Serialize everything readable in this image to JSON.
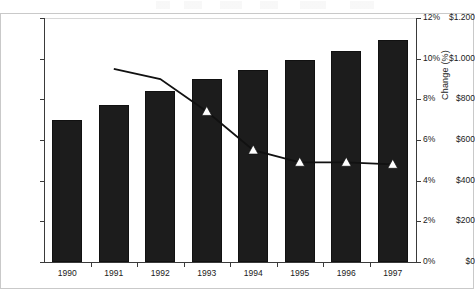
{
  "chart_data": {
    "type": "bar",
    "title": "",
    "subtitle": "",
    "xlabel": "",
    "ylabel": "",
    "categories": [
      "1990",
      "1991",
      "1992",
      "1993",
      "1994",
      "1995",
      "1996",
      "1997"
    ],
    "grid": false,
    "legend": "none",
    "series": [
      {
        "name": "Amount",
        "chart_type": "bar",
        "axis": "left",
        "values": [
          700,
          770,
          840,
          900,
          945,
          995,
          1040,
          1090
        ],
        "color": "#1c1c1c"
      },
      {
        "name": "Change (%)",
        "chart_type": "line",
        "axis": "right",
        "marker": "triangle-up",
        "marker_fill": "#ffffff",
        "color": "#111111",
        "values": [
          null,
          9.5,
          9.0,
          7.4,
          5.5,
          4.9,
          4.9,
          4.8
        ]
      }
    ],
    "left_axis": {
      "ylim": [
        0,
        1200
      ],
      "tick_values": [
        0,
        200,
        400,
        600,
        800,
        1000,
        1200
      ],
      "tick_labels": [
        "$0",
        "$200",
        "$400",
        "$600",
        "$800",
        "$1.000",
        "$1.200"
      ],
      "title": ""
    },
    "right_axis": {
      "ylim": [
        0,
        12
      ],
      "tick_values": [
        0,
        2,
        4,
        6,
        8,
        10,
        12
      ],
      "tick_labels": [
        "0%",
        "2%",
        "4%",
        "6%",
        "8%",
        "10%",
        "12%"
      ],
      "title": "Change (%)"
    }
  }
}
